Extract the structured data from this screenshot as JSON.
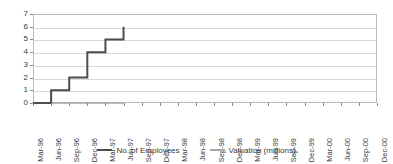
{
  "chart_data": {
    "type": "line",
    "title": "",
    "subtitle": "",
    "xlabel": "",
    "ylabel": "",
    "ylim": [
      0,
      7
    ],
    "y_ticks": [
      0,
      1,
      2,
      3,
      4,
      5,
      6,
      7
    ],
    "grid": true,
    "legend_position": "bottom",
    "step_style": "post",
    "categories": [
      "Mar-96",
      "Jun-96",
      "Sep-96",
      "Dec-96",
      "Mar-97",
      "Jun-97",
      "Sep-97",
      "Dec-97",
      "Mar-98",
      "Jun-98",
      "Sep-98",
      "Dec-98",
      "Mar-99",
      "Jun-99",
      "Sep-99",
      "Dec-99",
      "Mar-00",
      "Jun-00",
      "Sep-00",
      "Dec-00"
    ],
    "series": [
      {
        "name": "No. of Employees",
        "color": "#4d4d4d",
        "values": [
          0,
          1,
          2,
          4,
          5,
          6,
          null,
          null,
          null,
          null,
          null,
          null,
          null,
          null,
          null,
          null,
          null,
          null,
          null,
          null
        ]
      },
      {
        "name": "Valuation (millions)",
        "color": "#a6a6a6",
        "values": [
          0,
          0,
          0,
          0,
          0,
          0,
          null,
          null,
          null,
          null,
          null,
          null,
          null,
          null,
          null,
          null,
          null,
          null,
          null,
          null
        ]
      }
    ]
  },
  "legend": {
    "entries": [
      {
        "label": "No. of Employees",
        "color": "#4d4d4d"
      },
      {
        "label": "Valuation (millions)",
        "color": "#a6a6a6"
      }
    ]
  },
  "axes": {
    "y_tick_labels": [
      "7",
      "6",
      "5",
      "4",
      "3",
      "2",
      "1",
      "0"
    ],
    "x_tick_labels": [
      "Mar-96",
      "Jun-96",
      "Sep-96",
      "Dec-96",
      "Mar-97",
      "Jun-97",
      "Sep-97",
      "Dec-97",
      "Mar-98",
      "Jun-98",
      "Sep-98",
      "Dec-98",
      "Mar-99",
      "Jun-99",
      "Sep-99",
      "Dec-99",
      "Mar-00",
      "Jun-00",
      "Sep-00",
      "Dec-00"
    ]
  },
  "colors": {
    "employees_line": "#4d4d4d",
    "valuation_line": "#a6a6a6",
    "grid": "#d9d9d9",
    "border": "#b9b9b9",
    "text": "#3a3a3a",
    "background": "#ffffff"
  }
}
